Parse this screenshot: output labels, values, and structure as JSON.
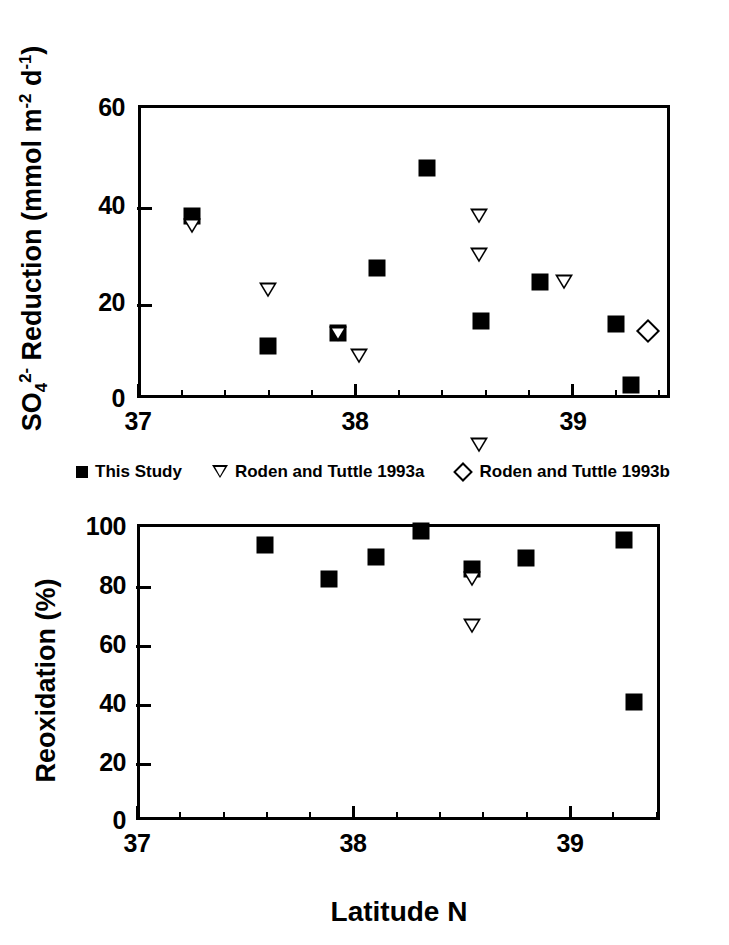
{
  "figure": {
    "xtitle": "Latitude N",
    "legend": [
      {
        "symbol": "filled-square",
        "label": "This Study"
      },
      {
        "symbol": "open-triangle-down",
        "label": "Roden and Tuttle 1993a"
      },
      {
        "symbol": "open-diamond",
        "label": "Roden and Tuttle 1993b"
      }
    ]
  },
  "chart_data": [
    {
      "type": "scatter",
      "panel": "top",
      "title": "",
      "xlabel": "Latitude N",
      "ylabel": "SO4 2- Reduction (mmol m-2 d-1)",
      "ylabel_parts": {
        "pre": "SO",
        "sub": "4",
        "sup": "2-",
        "post": " Reduction (mmol m",
        "sup2": "-2",
        "mid": " d",
        "sup3": "-1",
        "end": ")"
      },
      "xlim": [
        37,
        39.45
      ],
      "ylim": [
        0,
        60
      ],
      "xticks": [
        37,
        38,
        39
      ],
      "xticklabels": [
        "37",
        "38",
        "39"
      ],
      "xminor_step": 0.2,
      "yticks": [
        0,
        20,
        40,
        60
      ],
      "yticklabels": [
        "0",
        "20",
        "40",
        "60"
      ],
      "grid": false,
      "legend_position": "below-axes",
      "series": [
        {
          "name": "This Study",
          "marker": "filled-square",
          "points": [
            {
              "x": 37.25,
              "y": 37.2
            },
            {
              "x": 37.6,
              "y": 10.6
            },
            {
              "x": 37.92,
              "y": 13.4
            },
            {
              "x": 38.1,
              "y": 26.6
            },
            {
              "x": 38.33,
              "y": 47.0
            },
            {
              "x": 38.58,
              "y": 15.7
            },
            {
              "x": 38.85,
              "y": 23.8
            },
            {
              "x": 39.2,
              "y": 15.1
            },
            {
              "x": 39.27,
              "y": 2.7
            }
          ]
        },
        {
          "name": "Roden and Tuttle 1993a",
          "marker": "open-triangle-down",
          "points": [
            {
              "x": 37.25,
              "y": 35.3
            },
            {
              "x": 37.6,
              "y": 25.2
            },
            {
              "x": 37.92,
              "y": 19.3
            },
            {
              "x": 38.02,
              "y": 17.8
            },
            {
              "x": 38.57,
              "y": 49.6
            },
            {
              "x": 38.57,
              "y": 44.7
            },
            {
              "x": 38.57,
              "y": 8.9
            },
            {
              "x": 38.96,
              "y": 45.3
            }
          ]
        },
        {
          "name": "Roden and Tuttle 1993b",
          "marker": "open-diamond",
          "points": [
            {
              "x": 39.35,
              "y": 13.8
            }
          ]
        }
      ]
    },
    {
      "type": "scatter",
      "panel": "bottom",
      "title": "",
      "xlabel": "Latitude N",
      "ylabel": "Reoxidation (%)",
      "xlim": [
        37,
        39.45
      ],
      "ylim": [
        0,
        100
      ],
      "xticks": [
        37,
        38,
        39
      ],
      "xticklabels": [
        "37",
        "38",
        "39"
      ],
      "xminor_step": 0.2,
      "yticks": [
        0,
        20,
        40,
        60,
        80,
        100
      ],
      "yticklabels": [
        "0",
        "20",
        "40",
        "60",
        "80",
        "100"
      ],
      "grid": false,
      "legend_position": "none",
      "series": [
        {
          "name": "This Study",
          "marker": "filled-square",
          "points": [
            {
              "x": 37.6,
              "y": 93.0
            },
            {
              "x": 37.9,
              "y": 81.3
            },
            {
              "x": 38.12,
              "y": 89.0
            },
            {
              "x": 38.33,
              "y": 97.5
            },
            {
              "x": 38.57,
              "y": 84.8
            },
            {
              "x": 38.82,
              "y": 88.6
            },
            {
              "x": 39.28,
              "y": 94.6
            },
            {
              "x": 39.33,
              "y": 40.0
            }
          ]
        },
        {
          "name": "Roden and Tuttle 1993a",
          "marker": "open-triangle-down",
          "points": [
            {
              "x": 38.57,
              "y": 81.5
            },
            {
              "x": 38.57,
              "y": 70.5
            }
          ]
        }
      ]
    }
  ]
}
